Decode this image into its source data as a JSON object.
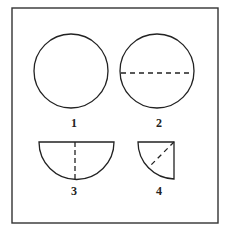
{
  "figure": {
    "frame_color": "#333333",
    "stroke_color": "#222222",
    "shapes": [
      {
        "id": "1",
        "label": "1",
        "kind": "full-circle",
        "fold_line": "none"
      },
      {
        "id": "2",
        "label": "2",
        "kind": "full-circle",
        "fold_line": "horizontal-diameter"
      },
      {
        "id": "3",
        "label": "3",
        "kind": "semicircle",
        "fold_line": "vertical-radius"
      },
      {
        "id": "4",
        "label": "4",
        "kind": "quarter-circle",
        "fold_line": "diagonal"
      }
    ]
  }
}
